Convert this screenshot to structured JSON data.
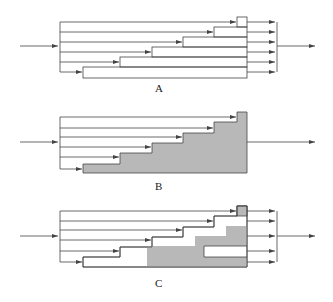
{
  "diagrams": [
    {
      "label": "A",
      "description": "staircase of unfilled blocks with per-row outputs"
    },
    {
      "label": "B",
      "description": "staircase filled grey, single output"
    },
    {
      "label": "C",
      "description": "staircase with partial grey fill, per-row outputs"
    }
  ],
  "colors": {
    "line": "#444444",
    "fill": "#b8b8b8",
    "background": "#ffffff"
  }
}
